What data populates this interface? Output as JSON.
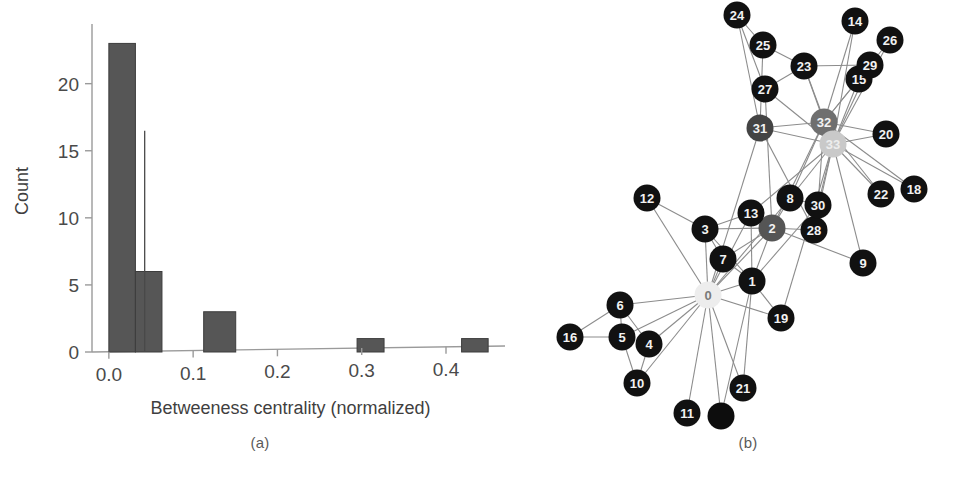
{
  "figure": {
    "panel_a_caption": "(a)",
    "panel_b_caption": "(b)"
  },
  "chart_data": [
    {
      "id": "betweenness-histogram",
      "type": "bar",
      "title": "",
      "xlabel": "Betweeness centrality (normalized)",
      "ylabel": "Count",
      "xlim": [
        -0.02,
        0.47
      ],
      "ylim": [
        0,
        24
      ],
      "xticks": [
        0.0,
        0.1,
        0.2,
        0.3,
        0.4
      ],
      "xticklabels": [
        "0.0",
        "0.1",
        "0.2",
        "0.3",
        "0.4"
      ],
      "yticks": [
        0,
        5,
        10,
        15,
        20
      ],
      "yticklabels": [
        "0",
        "5",
        "10",
        "15",
        "20"
      ],
      "grid": false,
      "legend": null,
      "bin_width": 0.0315,
      "bins": [
        {
          "x0": 0.0,
          "x1": 0.0315,
          "count": 23
        },
        {
          "x0": 0.0315,
          "x1": 0.063,
          "count": 6
        },
        {
          "x0": 0.063,
          "x1": 0.0945,
          "count": 0
        },
        {
          "x0": 0.0945,
          "x1": 0.126,
          "count": 0
        },
        {
          "x0": 0.1125,
          "x1": 0.1505,
          "count": 3
        },
        {
          "x0": 0.1505,
          "x1": 0.2945,
          "count": 0
        },
        {
          "x0": 0.2945,
          "x1": 0.3265,
          "count": 1
        },
        {
          "x0": 0.3265,
          "x1": 0.4185,
          "count": 0
        },
        {
          "x0": 0.4185,
          "x1": 0.45,
          "count": 1
        }
      ],
      "categories": [
        "0.00-0.03",
        "0.03-0.06",
        "0.11-0.15",
        "0.29-0.33",
        "0.42-0.45"
      ],
      "values": [
        23,
        6,
        3,
        1,
        1
      ],
      "marker_line": {
        "x": 0.0425,
        "y_top": 16.5,
        "y_bottom": 0
      }
    },
    {
      "id": "karate-club-network",
      "type": "graph",
      "title": "",
      "note": "Zachary karate club graph; node shading encodes betweenness centrality (lighter = higher)",
      "nodes": [
        {
          "id": "0",
          "label": "0",
          "x": 160,
          "y": 295,
          "shade": "#ededed",
          "text": "#7a7a7a"
        },
        {
          "id": "1",
          "label": "1",
          "x": 204,
          "y": 281,
          "shade": "#111111",
          "text": "#f2f2f2"
        },
        {
          "id": "2",
          "label": "2",
          "x": 224,
          "y": 228,
          "shade": "#555555",
          "text": "#f2f2f2"
        },
        {
          "id": "3",
          "label": "3",
          "x": 157,
          "y": 229,
          "shade": "#111111",
          "text": "#f2f2f2"
        },
        {
          "id": "4",
          "label": "4",
          "x": 101,
          "y": 344,
          "shade": "#111111",
          "text": "#f2f2f2"
        },
        {
          "id": "5",
          "label": "5",
          "x": 74,
          "y": 337,
          "shade": "#111111",
          "text": "#f2f2f2"
        },
        {
          "id": "6",
          "label": "6",
          "x": 72,
          "y": 305,
          "shade": "#111111",
          "text": "#f2f2f2"
        },
        {
          "id": "7",
          "label": "7",
          "x": 175,
          "y": 259,
          "shade": "#111111",
          "text": "#f2f2f2"
        },
        {
          "id": "8",
          "label": "8",
          "x": 242,
          "y": 198,
          "shade": "#111111",
          "text": "#f2f2f2"
        },
        {
          "id": "9",
          "label": "9",
          "x": 315,
          "y": 263,
          "shade": "#111111",
          "text": "#f2f2f2"
        },
        {
          "id": "10",
          "label": "10",
          "x": 89,
          "y": 383,
          "shade": "#111111",
          "text": "#f2f2f2"
        },
        {
          "id": "11",
          "label": "11",
          "x": 139,
          "y": 413,
          "shade": "#111111",
          "text": "#f2f2f2"
        },
        {
          "id": "12",
          "label": "12",
          "x": 99,
          "y": 198,
          "shade": "#111111",
          "text": "#f2f2f2"
        },
        {
          "id": "13",
          "label": "13",
          "x": 203,
          "y": 213,
          "shade": "#111111",
          "text": "#f2f2f2"
        },
        {
          "id": "14",
          "label": "14",
          "x": 307,
          "y": 21,
          "shade": "#111111",
          "text": "#f2f2f2"
        },
        {
          "id": "15",
          "label": "15",
          "x": 311,
          "y": 79,
          "shade": "#111111",
          "text": "#f2f2f2"
        },
        {
          "id": "16",
          "label": "16",
          "x": 22,
          "y": 337,
          "shade": "#111111",
          "text": "#f2f2f2"
        },
        {
          "id": "17",
          "label": "",
          "x": 173,
          "y": 416,
          "shade": "#0d0d0d",
          "text": "#0d0d0d"
        },
        {
          "id": "18",
          "label": "18",
          "x": 366,
          "y": 189,
          "shade": "#111111",
          "text": "#f2f2f2"
        },
        {
          "id": "19",
          "label": "19",
          "x": 233,
          "y": 318,
          "shade": "#111111",
          "text": "#f2f2f2"
        },
        {
          "id": "20",
          "label": "20",
          "x": 338,
          "y": 134,
          "shade": "#111111",
          "text": "#f2f2f2"
        },
        {
          "id": "21",
          "label": "21",
          "x": 195,
          "y": 388,
          "shade": "#111111",
          "text": "#f2f2f2"
        },
        {
          "id": "22",
          "label": "22",
          "x": 333,
          "y": 194,
          "shade": "#111111",
          "text": "#f2f2f2"
        },
        {
          "id": "23",
          "label": "23",
          "x": 256,
          "y": 66,
          "shade": "#111111",
          "text": "#f2f2f2"
        },
        {
          "id": "24",
          "label": "24",
          "x": 189,
          "y": 15,
          "shade": "#111111",
          "text": "#f2f2f2"
        },
        {
          "id": "25",
          "label": "25",
          "x": 215,
          "y": 45,
          "shade": "#111111",
          "text": "#f2f2f2"
        },
        {
          "id": "26",
          "label": "26",
          "x": 342,
          "y": 40,
          "shade": "#111111",
          "text": "#f2f2f2"
        },
        {
          "id": "27",
          "label": "27",
          "x": 217,
          "y": 89,
          "shade": "#111111",
          "text": "#f2f2f2"
        },
        {
          "id": "28",
          "label": "28",
          "x": 266,
          "y": 230,
          "shade": "#111111",
          "text": "#f2f2f2"
        },
        {
          "id": "29",
          "label": "29",
          "x": 322,
          "y": 65,
          "shade": "#111111",
          "text": "#f2f2f2"
        },
        {
          "id": "30",
          "label": "30",
          "x": 270,
          "y": 205,
          "shade": "#111111",
          "text": "#f2f2f2"
        },
        {
          "id": "31",
          "label": "31",
          "x": 212,
          "y": 128,
          "shade": "#444444",
          "text": "#f2f2f2"
        },
        {
          "id": "32",
          "label": "32",
          "x": 276,
          "y": 122,
          "shade": "#6f6f6f",
          "text": "#f2f2f2"
        },
        {
          "id": "33",
          "label": "33",
          "x": 285,
          "y": 144,
          "shade": "#c9c9c9",
          "text": "#ededed"
        }
      ],
      "edges": [
        [
          "0",
          "1"
        ],
        [
          "0",
          "2"
        ],
        [
          "0",
          "3"
        ],
        [
          "0",
          "4"
        ],
        [
          "0",
          "5"
        ],
        [
          "0",
          "6"
        ],
        [
          "0",
          "7"
        ],
        [
          "0",
          "8"
        ],
        [
          "0",
          "10"
        ],
        [
          "0",
          "11"
        ],
        [
          "0",
          "12"
        ],
        [
          "0",
          "13"
        ],
        [
          "0",
          "17"
        ],
        [
          "0",
          "19"
        ],
        [
          "0",
          "21"
        ],
        [
          "0",
          "31"
        ],
        [
          "1",
          "2"
        ],
        [
          "1",
          "3"
        ],
        [
          "1",
          "7"
        ],
        [
          "1",
          "13"
        ],
        [
          "1",
          "17"
        ],
        [
          "1",
          "19"
        ],
        [
          "1",
          "21"
        ],
        [
          "1",
          "30"
        ],
        [
          "2",
          "3"
        ],
        [
          "2",
          "7"
        ],
        [
          "2",
          "8"
        ],
        [
          "2",
          "9"
        ],
        [
          "2",
          "13"
        ],
        [
          "2",
          "27"
        ],
        [
          "2",
          "28"
        ],
        [
          "2",
          "32"
        ],
        [
          "3",
          "7"
        ],
        [
          "3",
          "12"
        ],
        [
          "3",
          "13"
        ],
        [
          "4",
          "6"
        ],
        [
          "4",
          "10"
        ],
        [
          "5",
          "6"
        ],
        [
          "5",
          "10"
        ],
        [
          "5",
          "16"
        ],
        [
          "6",
          "16"
        ],
        [
          "8",
          "30"
        ],
        [
          "8",
          "32"
        ],
        [
          "8",
          "33"
        ],
        [
          "9",
          "33"
        ],
        [
          "13",
          "33"
        ],
        [
          "14",
          "32"
        ],
        [
          "14",
          "33"
        ],
        [
          "15",
          "32"
        ],
        [
          "15",
          "33"
        ],
        [
          "18",
          "32"
        ],
        [
          "18",
          "33"
        ],
        [
          "19",
          "33"
        ],
        [
          "20",
          "32"
        ],
        [
          "20",
          "33"
        ],
        [
          "22",
          "32"
        ],
        [
          "22",
          "33"
        ],
        [
          "23",
          "25"
        ],
        [
          "23",
          "27"
        ],
        [
          "23",
          "29"
        ],
        [
          "23",
          "32"
        ],
        [
          "23",
          "33"
        ],
        [
          "24",
          "25"
        ],
        [
          "24",
          "27"
        ],
        [
          "24",
          "31"
        ],
        [
          "25",
          "31"
        ],
        [
          "26",
          "29"
        ],
        [
          "26",
          "33"
        ],
        [
          "27",
          "33"
        ],
        [
          "28",
          "31"
        ],
        [
          "28",
          "33"
        ],
        [
          "29",
          "32"
        ],
        [
          "29",
          "33"
        ],
        [
          "30",
          "32"
        ],
        [
          "30",
          "33"
        ],
        [
          "31",
          "32"
        ],
        [
          "31",
          "33"
        ],
        [
          "32",
          "33"
        ]
      ]
    }
  ]
}
